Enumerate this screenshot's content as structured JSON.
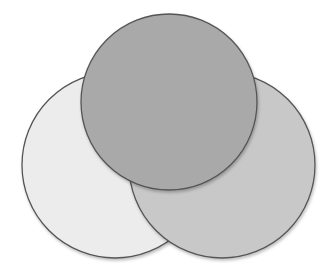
{
  "diagram": {
    "type": "overlapping-circles",
    "background": "#ffffff",
    "stroke_color": "#555555",
    "circles": [
      {
        "id": "left",
        "cx": 115,
        "cy": 165,
        "r": 93,
        "fill": "#ececec",
        "layer": 1
      },
      {
        "id": "right",
        "cx": 222,
        "cy": 165,
        "r": 93,
        "fill": "#c8c8c8",
        "layer": 2
      },
      {
        "id": "top",
        "cx": 169,
        "cy": 102,
        "r": 88,
        "fill": "#a9a9a9",
        "layer": 3
      }
    ],
    "labels": []
  }
}
